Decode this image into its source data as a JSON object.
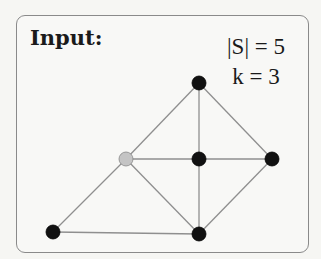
{
  "title": "Input:",
  "params": [
    {
      "var": "|S|",
      "op": "=",
      "val": "5",
      "label": "|S| = 5"
    },
    {
      "var": "k",
      "op": "=",
      "val": "3",
      "label": "k = 3"
    }
  ],
  "graph": {
    "nodes": [
      {
        "id": "top",
        "x": 199,
        "y": 83,
        "color": "#111111"
      },
      {
        "id": "gray",
        "x": 126,
        "y": 159,
        "color": "#c4c4c4"
      },
      {
        "id": "center",
        "x": 199,
        "y": 159,
        "color": "#111111"
      },
      {
        "id": "right",
        "x": 272,
        "y": 159,
        "color": "#111111"
      },
      {
        "id": "bottom-left",
        "x": 53,
        "y": 232,
        "color": "#111111"
      },
      {
        "id": "bottom",
        "x": 199,
        "y": 234,
        "color": "#111111"
      }
    ],
    "edges": [
      [
        "top",
        "gray"
      ],
      [
        "top",
        "center"
      ],
      [
        "top",
        "right"
      ],
      [
        "gray",
        "center"
      ],
      [
        "center",
        "right"
      ],
      [
        "gray",
        "bottom-left"
      ],
      [
        "gray",
        "bottom"
      ],
      [
        "center",
        "bottom"
      ],
      [
        "right",
        "bottom"
      ],
      [
        "bottom-left",
        "bottom"
      ]
    ]
  }
}
